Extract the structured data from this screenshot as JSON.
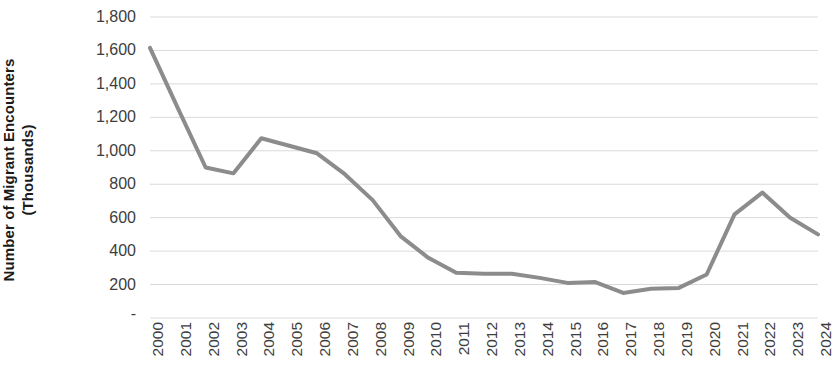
{
  "chart_data": {
    "type": "line",
    "title": "",
    "xlabel": "",
    "ylabel": "Number of Migrant Encounters (Thousands)",
    "ylabel_lines": [
      "Number of Migrant Encounters",
      "(Thousands)"
    ],
    "categories": [
      "2000",
      "2001",
      "2002",
      "2003",
      "2004",
      "2005",
      "2006",
      "2007",
      "2008",
      "2009",
      "2010",
      "2011",
      "2012",
      "2013",
      "2014",
      "2015",
      "2016",
      "2017",
      "2018",
      "2019",
      "2020",
      "2021",
      "2022",
      "2023",
      "2024"
    ],
    "values": [
      1615,
      1255,
      900,
      865,
      1075,
      1030,
      985,
      860,
      705,
      490,
      360,
      270,
      265,
      265,
      240,
      210,
      215,
      150,
      175,
      180,
      260,
      620,
      750,
      600,
      500
    ],
    "series": [
      {
        "name": "Migrant Encounters",
        "color": "#8c8c8c",
        "values": [
          1615,
          1255,
          900,
          865,
          1075,
          1030,
          985,
          860,
          705,
          490,
          360,
          270,
          265,
          265,
          240,
          210,
          215,
          150,
          175,
          180,
          260,
          620,
          750,
          600,
          500
        ]
      }
    ],
    "ylim": [
      0,
      1800
    ],
    "y_ticks": [
      0,
      200,
      400,
      600,
      800,
      1000,
      1200,
      1400,
      1600,
      1800
    ],
    "y_tick_labels": [
      "-",
      "200",
      "400",
      "600",
      "800",
      "1,000",
      "1,200",
      "1,400",
      "1,600",
      "1,800"
    ],
    "grid": true,
    "grid_color": "#d9d9d9",
    "legend": "none",
    "line_color": "#8c8c8c",
    "line_width": 4,
    "background": "#ffffff",
    "text_color": "#3d3d3d",
    "axis_title_color": "#1a1a1a"
  }
}
